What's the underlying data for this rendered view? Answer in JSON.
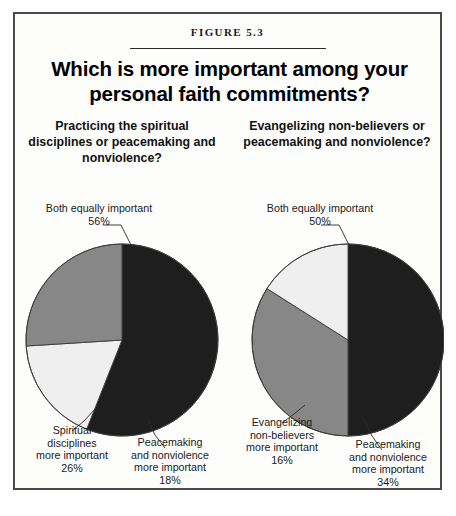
{
  "figure": {
    "number_label": "FIGURE 5.3",
    "title": "Which is more important among your personal faith commitments?"
  },
  "colors": {
    "dark_slice": "#1e1e1e",
    "medium_slice": "#878787",
    "light_slice": "#efefef",
    "outline": "#3a3a3a",
    "frame": "#4a4a4a",
    "background": "#fdfdfc",
    "text": "#111111"
  },
  "panels": [
    {
      "id": "left",
      "subtitle": "Practicing the spiritual disciplines or peacemaking and nonviolence?",
      "labels": {
        "top": "Both equally important\n56%",
        "left": "Spiritual\ndisciplines\nmore important\n26%",
        "right": "Peacemaking\nand nonviolence\nmore important\n18%"
      }
    },
    {
      "id": "right",
      "subtitle": "Evangelizing non-believers or peacemaking and nonviolence?",
      "labels": {
        "top": "Both equally important\n50%",
        "left": "Evangelizing\nnon-believers\nmore important\n16%",
        "right": "Peacemaking\nand nonviolence\nmore important\n34%"
      }
    }
  ],
  "chart_data": [
    {
      "type": "pie",
      "title": "Practicing the spiritual disciplines or peacemaking and nonviolence?",
      "categories": [
        "Both equally important",
        "Peacemaking and nonviolence more important",
        "Spiritual disciplines more important"
      ],
      "values": [
        56,
        18,
        26
      ],
      "value_labels": [
        "56%",
        "18%",
        "26%"
      ],
      "unit": "percent",
      "start_angle_deg": 0,
      "direction": "clockwise",
      "slice_colors": [
        "#1e1e1e",
        "#efefef",
        "#878787"
      ],
      "legend": "none",
      "grid": false
    },
    {
      "type": "pie",
      "title": "Evangelizing non-believers or peacemaking and nonviolence?",
      "categories": [
        "Both equally important",
        "Peacemaking and nonviolence more important",
        "Evangelizing non-believers more important"
      ],
      "values": [
        50,
        34,
        16
      ],
      "value_labels": [
        "50%",
        "34%",
        "16%"
      ],
      "unit": "percent",
      "start_angle_deg": 0,
      "direction": "clockwise",
      "slice_colors": [
        "#1e1e1e",
        "#878787",
        "#efefef"
      ],
      "legend": "none",
      "grid": false
    }
  ]
}
